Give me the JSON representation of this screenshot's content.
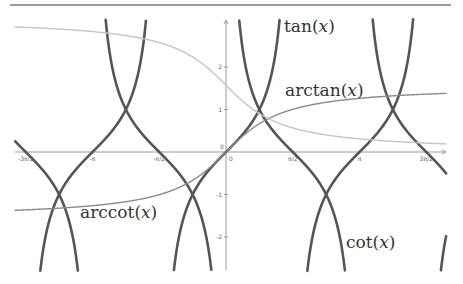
{
  "chart_data": {
    "type": "line",
    "title": "",
    "xlabel": "",
    "ylabel": "",
    "xlim": [
      -4.96,
      5.18
    ],
    "ylim": [
      -2.78,
      3.1
    ],
    "grid": false,
    "x_ticks": [
      {
        "value": -4.712,
        "label": "-3π/2"
      },
      {
        "value": -3.1416,
        "label": "-π"
      },
      {
        "value": -1.5708,
        "label": "-π/2"
      },
      {
        "value": 0,
        "label": "0"
      },
      {
        "value": 1.5708,
        "label": "π/2"
      },
      {
        "value": 3.1416,
        "label": "π"
      },
      {
        "value": 4.712,
        "label": "3π/2"
      }
    ],
    "y_ticks": [
      {
        "value": -2,
        "label": "-2"
      },
      {
        "value": -1,
        "label": "-1"
      },
      {
        "value": 1,
        "label": "1"
      },
      {
        "value": 2,
        "label": "2"
      }
    ],
    "series": [
      {
        "name": "tan(x)",
        "function": "tan",
        "color": "#555555",
        "width": 2.6
      },
      {
        "name": "cot(x)",
        "function": "cot",
        "color": "#555555",
        "width": 2.6
      },
      {
        "name": "arctan(x)",
        "function": "arctan",
        "color": "#8a8a8a",
        "width": 1.4
      },
      {
        "name": "arccot(x)",
        "function": "arccot",
        "color": "#c4c4c4",
        "width": 1.4
      }
    ],
    "annotations": [
      {
        "text": "tan(x)",
        "x": 1.34,
        "y": 3.0
      },
      {
        "text": "arctan(x)",
        "x": 1.39,
        "y": 1.55
      },
      {
        "text": "arccot(x)",
        "x": -3.45,
        "y": -1.3
      },
      {
        "text": "cot(x)",
        "x": 2.8,
        "y": -2.05
      }
    ]
  },
  "labels": {
    "tan": {
      "fn": "tan",
      "arg": "x"
    },
    "arctan": {
      "fn": "arctan",
      "arg": "x"
    },
    "arccot": {
      "fn": "arccot",
      "arg": "x"
    },
    "cot": {
      "fn": "cot",
      "arg": "x"
    }
  }
}
